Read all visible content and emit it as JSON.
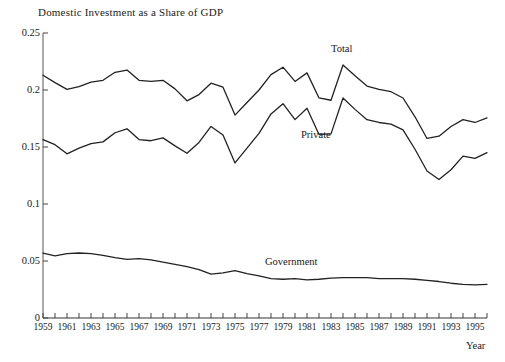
{
  "chart_data": {
    "type": "line",
    "title": "Domestic Investment as a Share of GDP",
    "xlabel": "Year",
    "ylabel": "",
    "xlim": [
      1959,
      1996
    ],
    "ylim": [
      0,
      0.25
    ],
    "grid": false,
    "legend_position": "inline-annotations",
    "y_ticks": [
      0,
      0.05,
      0.1,
      0.15,
      0.2,
      0.25
    ],
    "y_tick_labels": [
      "0",
      "0.05",
      "0.1",
      "0.15",
      "0.2",
      "0.25"
    ],
    "x_ticks": [
      1959,
      1960,
      1961,
      1962,
      1963,
      1964,
      1965,
      1966,
      1967,
      1968,
      1969,
      1970,
      1971,
      1972,
      1973,
      1974,
      1975,
      1976,
      1977,
      1978,
      1979,
      1980,
      1981,
      1982,
      1983,
      1984,
      1985,
      1986,
      1987,
      1988,
      1989,
      1990,
      1991,
      1992,
      1993,
      1994,
      1995,
      1996
    ],
    "x_tick_labels": [
      "1959",
      "1961",
      "1963",
      "1965",
      "1967",
      "1969",
      "1971",
      "1973",
      "1975",
      "1977",
      "1979",
      "1981",
      "1983",
      "1985",
      "1987",
      "1989",
      "1991",
      "1993",
      "1995"
    ],
    "x_tick_label_years": [
      1959,
      1961,
      1963,
      1965,
      1967,
      1969,
      1971,
      1973,
      1975,
      1977,
      1979,
      1981,
      1983,
      1985,
      1987,
      1989,
      1991,
      1993,
      1995
    ],
    "x": [
      1959,
      1960,
      1961,
      1962,
      1963,
      1964,
      1965,
      1966,
      1967,
      1968,
      1969,
      1970,
      1971,
      1972,
      1973,
      1974,
      1975,
      1976,
      1977,
      1978,
      1979,
      1980,
      1981,
      1982,
      1983,
      1984,
      1985,
      1986,
      1987,
      1988,
      1989,
      1990,
      1991,
      1992,
      1993,
      1994,
      1995,
      1996
    ],
    "series": [
      {
        "name": "Total",
        "color": "#222222",
        "label_position": {
          "x": 1984.5,
          "y": 0.235
        },
        "values": [
          0.213,
          0.2065,
          0.2005,
          0.203,
          0.207,
          0.2085,
          0.2155,
          0.2175,
          0.2085,
          0.2075,
          0.2085,
          0.201,
          0.1905,
          0.196,
          0.206,
          0.2025,
          0.178,
          0.189,
          0.2,
          0.2135,
          0.22,
          0.2075,
          0.215,
          0.193,
          0.191,
          0.222,
          0.2125,
          0.2035,
          0.2005,
          0.1985,
          0.193,
          0.1765,
          0.1575,
          0.1595,
          0.168,
          0.174,
          0.1715,
          0.1755
        ]
      },
      {
        "name": "Private",
        "color": "#222222",
        "label_position": {
          "x": 1982.0,
          "y": 0.16
        },
        "values": [
          0.1565,
          0.152,
          0.144,
          0.149,
          0.153,
          0.1545,
          0.1625,
          0.166,
          0.1565,
          0.1555,
          0.158,
          0.151,
          0.1445,
          0.154,
          0.168,
          0.1605,
          0.136,
          0.149,
          0.162,
          0.179,
          0.188,
          0.174,
          0.184,
          0.161,
          0.1615,
          0.193,
          0.183,
          0.174,
          0.1715,
          0.17,
          0.165,
          0.148,
          0.129,
          0.1215,
          0.13,
          0.142,
          0.14,
          0.145
        ]
      },
      {
        "name": "Government",
        "color": "#222222",
        "label_position": {
          "x": 1979.0,
          "y": 0.048
        },
        "values": [
          0.057,
          0.0545,
          0.0565,
          0.057,
          0.0565,
          0.055,
          0.053,
          0.0515,
          0.052,
          0.051,
          0.049,
          0.047,
          0.045,
          0.0425,
          0.0385,
          0.0395,
          0.0415,
          0.039,
          0.037,
          0.0345,
          0.034,
          0.0345,
          0.0335,
          0.034,
          0.035,
          0.0355,
          0.0355,
          0.0355,
          0.0345,
          0.0345,
          0.0345,
          0.034,
          0.033,
          0.032,
          0.0305,
          0.0295,
          0.029,
          0.0295
        ]
      }
    ]
  },
  "axes": {
    "title": "Domestic Investment as a Share of GDP",
    "x_axis_title": "Year",
    "series_labels": {
      "total": "Total",
      "private": "Private",
      "government": "Government"
    }
  }
}
